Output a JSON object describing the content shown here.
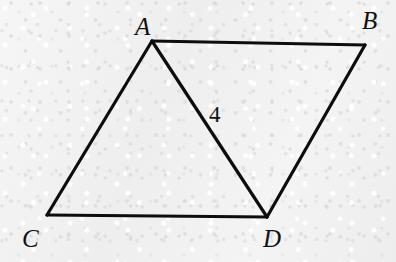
{
  "figure": {
    "background_color": "#f1f1f1",
    "stroke_color": "#0d0d0d",
    "stroke_width": 3,
    "canvas": {
      "width": 396,
      "height": 262
    }
  },
  "vertices": [
    {
      "id": "A",
      "label": "A",
      "x": 152,
      "y": 41,
      "label_x": 135,
      "label_y": 14
    },
    {
      "id": "B",
      "label": "B",
      "x": 365,
      "y": 45,
      "label_x": 362,
      "label_y": 8
    },
    {
      "id": "C",
      "label": "C",
      "x": 47,
      "y": 215,
      "label_x": 22,
      "label_y": 226
    },
    {
      "id": "D",
      "label": "D",
      "x": 267,
      "y": 217,
      "label_x": 263,
      "label_y": 226
    }
  ],
  "segments": [
    {
      "id": "AB",
      "from": "A",
      "to": "B",
      "x1": 152,
      "y1": 41,
      "x2": 365,
      "y2": 45
    },
    {
      "id": "AC",
      "from": "A",
      "to": "C",
      "x1": 152,
      "y1": 41,
      "x2": 47,
      "y2": 215
    },
    {
      "id": "CD",
      "from": "C",
      "to": "D",
      "x1": 47,
      "y1": 215,
      "x2": 267,
      "y2": 217
    },
    {
      "id": "BD",
      "from": "B",
      "to": "D",
      "x1": 365,
      "y1": 45,
      "x2": 267,
      "y2": 217
    },
    {
      "id": "AD",
      "from": "A",
      "to": "D",
      "x1": 152,
      "y1": 41,
      "x2": 267,
      "y2": 217
    }
  ],
  "measures": [
    {
      "id": "AD-length",
      "label": "4",
      "segment": "AD",
      "x": 209,
      "y": 103
    }
  ]
}
